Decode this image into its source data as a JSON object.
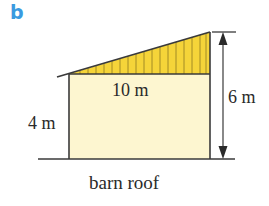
{
  "part_label": "b",
  "caption": "barn roof",
  "dimensions": {
    "roof_width": "10 m",
    "wall_height": "4 m",
    "total_height": "6 m"
  },
  "colors": {
    "part_label": "#3a9ae0",
    "wall_fill": "#fdf6d0",
    "roof_fill": "#f5d43a",
    "hatch": "#6b5a1a",
    "stroke": "#3a3a3a",
    "text": "#2a2a2a"
  },
  "geometry": {
    "wall": {
      "x": 69,
      "y": 74,
      "width": 141,
      "height": 85
    },
    "roof_triangle": [
      [
        69,
        74
      ],
      [
        210,
        32
      ],
      [
        210,
        74
      ]
    ],
    "roof_overhang": [
      [
        57,
        77
      ],
      [
        69,
        74
      ]
    ],
    "ground_line": [
      [
        38,
        159
      ],
      [
        235,
        159
      ]
    ],
    "dimension_arrow": {
      "x": 223,
      "y_top": 32,
      "y_bottom": 159,
      "tick_x1": 212,
      "tick_x2": 236
    }
  }
}
